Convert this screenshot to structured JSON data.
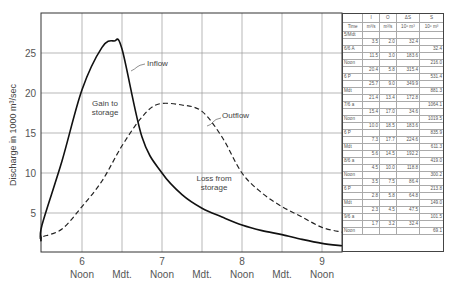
{
  "chart_data": {
    "type": "line",
    "title": "",
    "xlabel": "",
    "ylabel": "Discharge in 1000 m³/sec",
    "ylim": [
      0.6,
      29.5
    ],
    "yticks": [
      5,
      10,
      15,
      20,
      25
    ],
    "xticks": [
      {
        "day": "6",
        "label": "Noon"
      },
      {
        "day": "",
        "label": "Mdt."
      },
      {
        "day": "7",
        "label": "Noon"
      },
      {
        "day": "",
        "label": "Mdt."
      },
      {
        "day": "8",
        "label": "Noon"
      },
      {
        "day": "",
        "label": "Mdt."
      },
      {
        "day": "9",
        "label": "Noon"
      }
    ],
    "grid": true,
    "series": [
      {
        "name": "Inflow",
        "style": "solid",
        "x": [
          5.0,
          5.25,
          5.5,
          5.75,
          6.0,
          6.25,
          6.4,
          6.5,
          6.75,
          7.0,
          7.25,
          7.5,
          7.75,
          8.0,
          8.25,
          8.5,
          8.75,
          9.0,
          9.25
        ],
        "y": [
          2.0,
          1.6,
          3.5,
          11.5,
          20.4,
          25.7,
          26.5,
          25.5,
          14.5,
          10.0,
          7.3,
          5.6,
          4.5,
          3.5,
          2.8,
          2.3,
          1.7,
          1.2,
          0.9
        ]
      },
      {
        "name": "Outflow",
        "style": "dashed",
        "x": [
          5.0,
          5.25,
          5.5,
          5.75,
          6.0,
          6.25,
          6.5,
          6.75,
          6.95,
          7.25,
          7.5,
          7.75,
          8.0,
          8.25,
          8.5,
          8.75,
          9.0,
          9.25
        ],
        "y": [
          2.2,
          1.8,
          2.0,
          3.0,
          5.8,
          9.0,
          13.4,
          17.0,
          18.6,
          18.5,
          17.7,
          14.5,
          10.0,
          7.5,
          5.8,
          4.5,
          3.2,
          2.6
        ]
      }
    ],
    "annotations": [
      "Inflow",
      "Outflow",
      "Gain to storage",
      "Loss from storage"
    ],
    "table": {
      "headers": [
        {
          "sym": "",
          "unit": "Time"
        },
        {
          "sym": "I",
          "unit": "m³/s"
        },
        {
          "sym": "O",
          "unit": "m³/s"
        },
        {
          "sym": "ΔS",
          "unit": "10⁶ m³"
        },
        {
          "sym": "S",
          "unit": "10⁶ m³"
        }
      ],
      "time_rows": [
        {
          "time": "5/Mdt",
          "S": ""
        },
        {
          "time": "6/6 A",
          "S": "32.4"
        },
        {
          "time": "Noon",
          "S": "216.0"
        },
        {
          "time": "6 P",
          "S": "531.4"
        },
        {
          "time": "Mdt",
          "S": "881.3"
        },
        {
          "time": "7/6 a",
          "S": "1064.1"
        },
        {
          "time": "Noon",
          "S": "1019.5"
        },
        {
          "time": "6 P",
          "S": "835.9"
        },
        {
          "time": "Mdt",
          "S": "611.3"
        },
        {
          "time": "8/6 a",
          "S": "419.0"
        },
        {
          "time": "Noon",
          "S": "300.2"
        },
        {
          "time": "6 P",
          "S": "213.8"
        },
        {
          "time": "Mdt",
          "S": "149.0"
        },
        {
          "time": "9/6 a",
          "S": "101.5"
        },
        {
          "time": "Noon",
          "S": "69.1"
        }
      ],
      "interval_rows": [
        {
          "I": "3.5",
          "O": "2.0",
          "dS": "32.4"
        },
        {
          "I": "11.5",
          "O": "3.0",
          "dS": "183.6"
        },
        {
          "I": "20.4",
          "O": "5.8",
          "dS": "315.4"
        },
        {
          "I": "25.7",
          "O": "9.0",
          "dS": "349.9"
        },
        {
          "I": "21.4",
          "O": "13.4",
          "dS": "172.8"
        },
        {
          "I": "15.4",
          "O": "17.0",
          "dS": "34.6"
        },
        {
          "I": "10.0",
          "O": "18.5",
          "dS": "183.6"
        },
        {
          "I": "7.3",
          "O": "17.7",
          "dS": "224.6"
        },
        {
          "I": "5.6",
          "O": "14.5",
          "dS": "192.2"
        },
        {
          "I": "4.5",
          "O": "10.0",
          "dS": "118.8"
        },
        {
          "I": "3.5",
          "O": "7.5",
          "dS": "86.4"
        },
        {
          "I": "2.8",
          "O": "5.8",
          "dS": "64.8"
        },
        {
          "I": "2.3",
          "O": "4.5",
          "dS": "47.5"
        },
        {
          "I": "1.7",
          "O": "3.2",
          "dS": "32.4"
        }
      ]
    }
  },
  "labels": {
    "ylabel": "Discharge in 1000 m³/sec",
    "inflow": "Inflow",
    "outflow": "Outflow",
    "gain_1": "Gain to",
    "gain_2": "storage",
    "loss_1": "Loss from",
    "loss_2": "storage"
  }
}
